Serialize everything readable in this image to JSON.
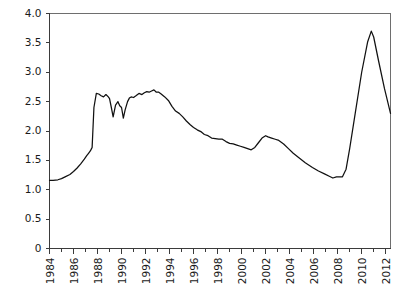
{
  "chart_data": {
    "type": "line",
    "title": "",
    "subtitle": "",
    "xlabel": "",
    "ylabel": "",
    "xlim": [
      1984,
      2012.4
    ],
    "ylim": [
      0,
      4.0
    ],
    "grid": false,
    "legend": null,
    "legend_position": "none",
    "line_color": "#111111",
    "y_ticks": [
      0,
      0.5,
      1.0,
      1.5,
      2.0,
      2.5,
      3.0,
      3.5,
      4.0
    ],
    "y_tick_labels": [
      "0",
      "0.5",
      "1.0",
      "1.5",
      "2.0",
      "2.5",
      "3.0",
      "3.5",
      "4.0"
    ],
    "x_ticks": [
      1984,
      1986,
      1988,
      1990,
      1992,
      1994,
      1996,
      1998,
      2000,
      2002,
      2004,
      2006,
      2008,
      2010,
      2012
    ],
    "x_tick_labels": [
      "1984",
      "1986",
      "1988",
      "1990",
      "1992",
      "1994",
      "1996",
      "1998",
      "2000",
      "2002",
      "2004",
      "2006",
      "2008",
      "2010",
      "2012"
    ],
    "x_minor_step": 1,
    "series": [
      {
        "name": "value",
        "x": [
          1984.0,
          1984.3,
          1984.7,
          1985.0,
          1985.3,
          1985.7,
          1986.0,
          1986.3,
          1986.6,
          1986.9,
          1987.1,
          1987.25,
          1987.4,
          1987.5,
          1987.55,
          1987.6,
          1987.7,
          1987.9,
          1988.1,
          1988.3,
          1988.5,
          1988.7,
          1988.9,
          1989.0,
          1989.15,
          1989.3,
          1989.5,
          1989.7,
          1989.85,
          1990.0,
          1990.15,
          1990.3,
          1990.5,
          1990.65,
          1990.8,
          1991.0,
          1991.2,
          1991.45,
          1991.7,
          1991.9,
          1992.1,
          1992.3,
          1992.5,
          1992.7,
          1992.9,
          1993.1,
          1993.3,
          1993.6,
          1993.9,
          1994.2,
          1994.5,
          1994.8,
          1995.1,
          1995.4,
          1995.7,
          1996.0,
          1996.3,
          1996.6,
          1996.9,
          1997.2,
          1997.5,
          1997.8,
          1998.1,
          1998.4,
          1998.7,
          1999.0,
          1999.3,
          1999.6,
          1999.9,
          2000.2,
          2000.5,
          2000.8,
          2001.1,
          2001.4,
          2001.7,
          2002.0,
          2002.2,
          2002.5,
          2002.8,
          2003.1,
          2003.5,
          2003.9,
          2004.3,
          2004.8,
          2005.3,
          2005.9,
          2006.4,
          2006.9,
          2007.3,
          2007.6,
          2007.9,
          2008.1,
          2008.4,
          2008.7,
          2009.0,
          2009.5,
          2010.0,
          2010.5,
          2010.8,
          2011.0,
          2011.4,
          2011.9,
          2012.4
        ],
        "y": [
          1.16,
          1.16,
          1.17,
          1.19,
          1.22,
          1.26,
          1.31,
          1.37,
          1.44,
          1.52,
          1.58,
          1.62,
          1.66,
          1.7,
          1.72,
          1.95,
          2.4,
          2.64,
          2.63,
          2.6,
          2.58,
          2.62,
          2.58,
          2.55,
          2.4,
          2.24,
          2.44,
          2.5,
          2.43,
          2.4,
          2.22,
          2.36,
          2.5,
          2.56,
          2.58,
          2.57,
          2.6,
          2.64,
          2.62,
          2.65,
          2.67,
          2.66,
          2.68,
          2.7,
          2.66,
          2.66,
          2.63,
          2.58,
          2.52,
          2.42,
          2.34,
          2.3,
          2.24,
          2.17,
          2.11,
          2.06,
          2.02,
          1.99,
          1.94,
          1.92,
          1.88,
          1.87,
          1.86,
          1.86,
          1.82,
          1.79,
          1.78,
          1.76,
          1.74,
          1.72,
          1.7,
          1.68,
          1.72,
          1.8,
          1.88,
          1.92,
          1.9,
          1.88,
          1.86,
          1.84,
          1.78,
          1.7,
          1.62,
          1.54,
          1.46,
          1.38,
          1.32,
          1.27,
          1.23,
          1.2,
          1.22,
          1.22,
          1.22,
          1.35,
          1.7,
          2.35,
          3.0,
          3.52,
          3.7,
          3.6,
          3.2,
          2.72,
          2.3
        ]
      }
    ]
  }
}
